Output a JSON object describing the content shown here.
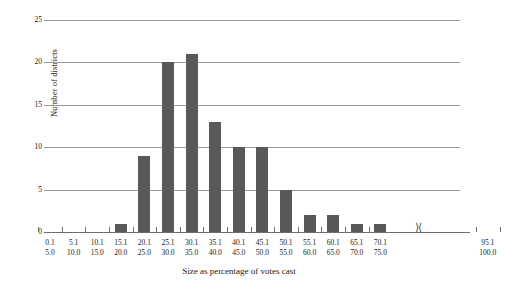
{
  "chart_data": {
    "type": "bar",
    "title": "",
    "xlabel": "Size as percentage of votes cast",
    "ylabel": "Number of districts",
    "categories": [
      "0.1–5.0",
      "5.1–10.0",
      "10.1–15.0",
      "15.1–20.0",
      "20.1–25.0",
      "25.1–30.0",
      "30.1–35.0",
      "35.1–40.0",
      "40.1–45.0",
      "45.1–50.0",
      "50.1–55.0",
      "55.1–60.0",
      "60.1–65.0",
      "65.1–70.0",
      "70.1–75.0",
      "95.1–100.0"
    ],
    "bin_labels_top": [
      "0.1",
      "5.1",
      "10.1",
      "15.1",
      "20.1",
      "25.1",
      "30.1",
      "35.1",
      "40.1",
      "45.1",
      "50.1",
      "55.1",
      "60.1",
      "65.1",
      "70.1",
      "95.1"
    ],
    "bin_labels_bottom": [
      "5.0",
      "10.0",
      "15.0",
      "20.0",
      "25.0",
      "30.0",
      "35.0",
      "40.0",
      "45.0",
      "50.0",
      "55.0",
      "60.0",
      "65.0",
      "70.0",
      "75.0",
      "100.0"
    ],
    "values": [
      0,
      0,
      0,
      1,
      9,
      20,
      21,
      13,
      10,
      10,
      5,
      2,
      2,
      1,
      1,
      0
    ],
    "yticks": [
      0,
      5,
      10,
      15,
      20,
      25
    ],
    "ylim": [
      0,
      25
    ],
    "grid": true,
    "legend": "none",
    "axis_break": {
      "symbol": "⟩⟨",
      "between": [
        "70.1–75.0",
        "95.1–100.0"
      ]
    },
    "bar_color": "#595959"
  }
}
